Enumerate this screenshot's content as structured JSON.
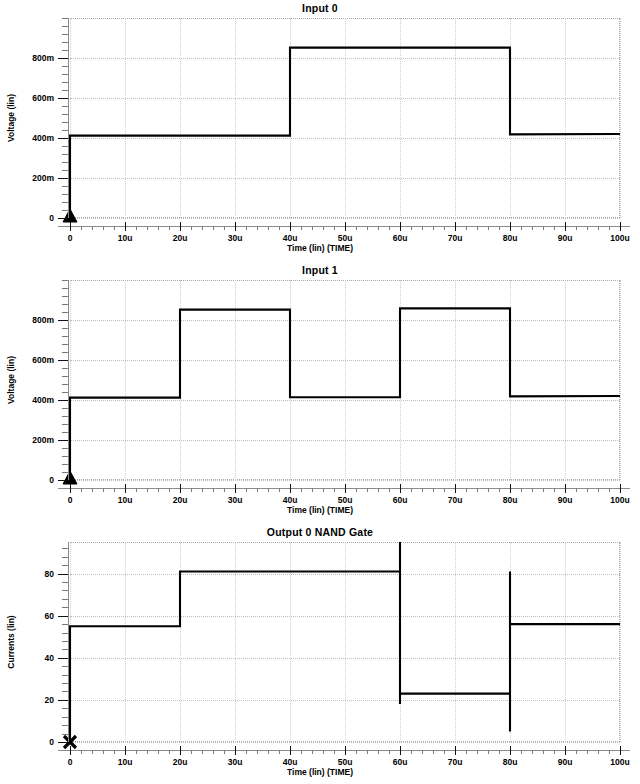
{
  "app": {
    "window_title": "SPICE Waveform Viewer"
  },
  "axis": {
    "x_title": "Time (lin) (TIME)",
    "x_ticks": [
      "0",
      "10u",
      "20u",
      "30u",
      "40u",
      "50u",
      "60u",
      "70u",
      "80u",
      "90u",
      "100u"
    ],
    "voltage_title": "Voltage (lin)",
    "voltage_ticks": [
      "800m",
      "600m",
      "400m",
      "200m",
      "0"
    ],
    "current_title": "Currents (lin)",
    "current_ticks": [
      "80",
      "60",
      "40",
      "20",
      "0"
    ]
  },
  "colors": {
    "trace": "#000000",
    "grid": "#bdbdbd",
    "frame": "#a8a8a8",
    "background": "#ffffff"
  },
  "panels": [
    {
      "title": "Input 0",
      "marker": "triangle-marker",
      "y_title": "Voltage (lin)"
    },
    {
      "title": "Input 1",
      "marker": "triangle-marker",
      "y_title": "Voltage (lin)"
    },
    {
      "title": "Output 0 NAND Gate",
      "marker": "x-marker",
      "y_title": "Currents (lin)"
    }
  ],
  "chart_data": [
    {
      "type": "line",
      "title": "Input 0",
      "xlabel": "Time (lin) (TIME)",
      "ylabel": "Voltage (lin)",
      "xlim": [
        0,
        100
      ],
      "ylim": [
        0,
        1000
      ],
      "x_unit": "u",
      "y_unit": "m",
      "grid": true,
      "legend": "none",
      "marker": "triangle",
      "x_ticks": [
        0,
        10,
        20,
        30,
        40,
        50,
        60,
        70,
        80,
        90,
        100
      ],
      "x_tick_labels": [
        "0",
        "10u",
        "20u",
        "30u",
        "40u",
        "50u",
        "60u",
        "70u",
        "80u",
        "90u",
        "100u"
      ],
      "y_ticks": [
        0,
        200,
        400,
        600,
        800
      ],
      "y_tick_labels": [
        "0",
        "200m",
        "400m",
        "600m",
        "800m"
      ],
      "series": [
        {
          "name": "Input 0",
          "x": [
            0,
            0,
            40,
            40,
            80,
            80,
            100
          ],
          "y": [
            0,
            412,
            412,
            852,
            852,
            418,
            420
          ]
        }
      ]
    },
    {
      "type": "line",
      "title": "Input 1",
      "xlabel": "Time (lin) (TIME)",
      "ylabel": "Voltage (lin)",
      "xlim": [
        0,
        100
      ],
      "ylim": [
        0,
        1000
      ],
      "x_unit": "u",
      "y_unit": "m",
      "grid": true,
      "legend": "none",
      "marker": "triangle",
      "x_ticks": [
        0,
        10,
        20,
        30,
        40,
        50,
        60,
        70,
        80,
        90,
        100
      ],
      "x_tick_labels": [
        "0",
        "10u",
        "20u",
        "30u",
        "40u",
        "50u",
        "60u",
        "70u",
        "80u",
        "90u",
        "100u"
      ],
      "y_ticks": [
        0,
        200,
        400,
        600,
        800
      ],
      "y_tick_labels": [
        "0",
        "200m",
        "400m",
        "600m",
        "800m"
      ],
      "series": [
        {
          "name": "Input 1",
          "x": [
            0,
            0,
            20,
            20,
            40,
            40,
            60,
            60,
            80,
            80,
            100
          ],
          "y": [
            0,
            412,
            412,
            852,
            852,
            414,
            414,
            858,
            858,
            418,
            420
          ]
        }
      ]
    },
    {
      "type": "line",
      "title": "Output 0 NAND Gate",
      "xlabel": "Time (lin) (TIME)",
      "ylabel": "Currents (lin)",
      "xlim": [
        0,
        100
      ],
      "ylim": [
        0,
        95
      ],
      "x_unit": "u",
      "y_unit": "",
      "grid": true,
      "legend": "none",
      "marker": "x",
      "x_ticks": [
        0,
        10,
        20,
        30,
        40,
        50,
        60,
        70,
        80,
        90,
        100
      ],
      "x_tick_labels": [
        "0",
        "10u",
        "20u",
        "30u",
        "40u",
        "50u",
        "60u",
        "70u",
        "80u",
        "90u",
        "100u"
      ],
      "y_ticks": [
        0,
        20,
        40,
        60,
        80
      ],
      "y_tick_labels": [
        "0",
        "20",
        "40",
        "60",
        "80"
      ],
      "series": [
        {
          "name": "Output 0",
          "x": [
            0,
            0,
            20,
            20,
            60,
            60,
            60,
            60,
            80,
            80,
            80,
            80,
            100
          ],
          "y": [
            0,
            55,
            55,
            81,
            81,
            95,
            18,
            23,
            23,
            5,
            81,
            56,
            56
          ]
        }
      ]
    }
  ]
}
